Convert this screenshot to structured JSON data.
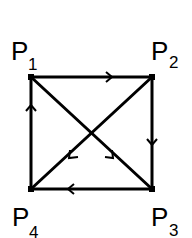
{
  "diagram": {
    "type": "directed-graph",
    "nodes": [
      {
        "id": "P1",
        "label": "P",
        "sub": "1",
        "x": 31,
        "y": 77
      },
      {
        "id": "P2",
        "label": "P",
        "sub": "2",
        "x": 152,
        "y": 77
      },
      {
        "id": "P3",
        "label": "P",
        "sub": "3",
        "x": 152,
        "y": 189
      },
      {
        "id": "P4",
        "label": "P",
        "sub": "4",
        "x": 31,
        "y": 189
      }
    ],
    "edges": [
      {
        "from": "P1",
        "to": "P2"
      },
      {
        "from": "P2",
        "to": "P3"
      },
      {
        "from": "P3",
        "to": "P4"
      },
      {
        "from": "P4",
        "to": "P1"
      },
      {
        "from": "P1",
        "to": "P3"
      },
      {
        "from": "P2",
        "to": "P4"
      }
    ],
    "colors": {
      "line": "#000000",
      "background": "#ffffff"
    }
  }
}
